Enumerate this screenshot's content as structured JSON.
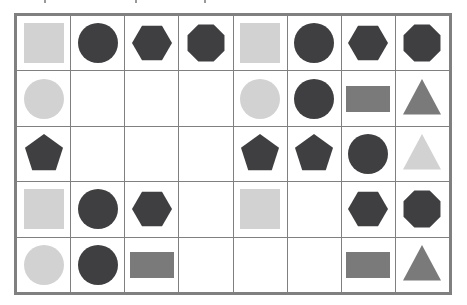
{
  "page": {
    "background_color": "#ffffff",
    "width": 467,
    "height": 305
  },
  "palette": {
    "dark": "#3f3f42",
    "medium_gray": "#7a7a7a",
    "light_gray": "#d2d2d2",
    "grid_line": "#808080",
    "cell_background": "#ffffff"
  },
  "grid": {
    "rows": 5,
    "columns": 8,
    "left": 14,
    "top": 13,
    "width": 438,
    "height": 282,
    "cell_width": 54.75,
    "cell_height": 56.4,
    "border_width": 2,
    "line_width": 1
  },
  "shape_names": [
    "square",
    "circle",
    "hexagon",
    "octagon",
    "pentagon",
    "rectangle",
    "triangle",
    "empty"
  ],
  "color_names": [
    "dark",
    "medium_gray",
    "light_gray"
  ],
  "cells": [
    [
      {
        "shape": "square",
        "color": "light_gray"
      },
      {
        "shape": "circle",
        "color": "dark"
      },
      {
        "shape": "hexagon",
        "color": "dark"
      },
      {
        "shape": "octagon",
        "color": "dark"
      },
      {
        "shape": "square",
        "color": "light_gray"
      },
      {
        "shape": "circle",
        "color": "dark"
      },
      {
        "shape": "hexagon",
        "color": "dark"
      },
      {
        "shape": "octagon",
        "color": "dark"
      }
    ],
    [
      {
        "shape": "circle",
        "color": "light_gray"
      },
      {
        "shape": "empty",
        "color": null
      },
      {
        "shape": "empty",
        "color": null
      },
      {
        "shape": "empty",
        "color": null
      },
      {
        "shape": "circle",
        "color": "light_gray"
      },
      {
        "shape": "circle",
        "color": "dark"
      },
      {
        "shape": "rectangle",
        "color": "medium_gray"
      },
      {
        "shape": "triangle",
        "color": "medium_gray"
      }
    ],
    [
      {
        "shape": "pentagon",
        "color": "dark"
      },
      {
        "shape": "empty",
        "color": null
      },
      {
        "shape": "empty",
        "color": null
      },
      {
        "shape": "empty",
        "color": null
      },
      {
        "shape": "pentagon",
        "color": "dark"
      },
      {
        "shape": "pentagon",
        "color": "dark"
      },
      {
        "shape": "circle",
        "color": "dark"
      },
      {
        "shape": "triangle",
        "color": "light_gray"
      }
    ],
    [
      {
        "shape": "square",
        "color": "light_gray"
      },
      {
        "shape": "circle",
        "color": "dark"
      },
      {
        "shape": "hexagon",
        "color": "dark"
      },
      {
        "shape": "empty",
        "color": null
      },
      {
        "shape": "square",
        "color": "light_gray"
      },
      {
        "shape": "empty",
        "color": null
      },
      {
        "shape": "hexagon",
        "color": "dark"
      },
      {
        "shape": "octagon",
        "color": "dark"
      }
    ],
    [
      {
        "shape": "circle",
        "color": "light_gray"
      },
      {
        "shape": "circle",
        "color": "dark"
      },
      {
        "shape": "rectangle",
        "color": "medium_gray"
      },
      {
        "shape": "empty",
        "color": null
      },
      {
        "shape": "empty",
        "color": null
      },
      {
        "shape": "empty",
        "color": null
      },
      {
        "shape": "rectangle",
        "color": "medium_gray"
      },
      {
        "shape": "triangle",
        "color": "medium_gray"
      }
    ]
  ]
}
